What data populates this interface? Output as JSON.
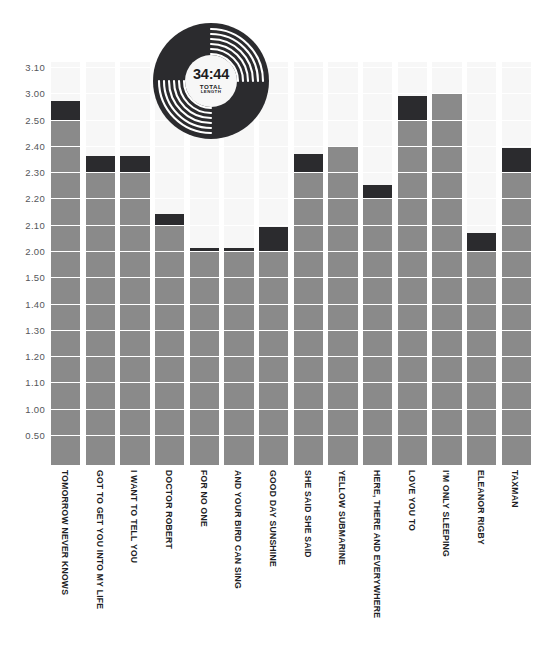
{
  "colors": {
    "bar_gray": "#8a8a8a",
    "bar_dark": "#2b2b2e",
    "column_bg": "#f7f7f7",
    "gridline": "#ffffff",
    "axis": "#b9b9b9",
    "tick_text": "#55565a",
    "label_text": "#1d1d1f"
  },
  "record": {
    "total_time": "34:44",
    "caption_line1": "TOTAL",
    "caption_line2": "LENGTH"
  },
  "chart_data": {
    "type": "bar",
    "title": "",
    "subtitle": "",
    "xlabel": "",
    "ylabel": "",
    "grid": true,
    "legend": "none",
    "note": "Stacked bar: gray body = whole tick increments, dark cap = remaining seconds above last tick. Y axis is a mm.ss time scale.",
    "ytick_labels": [
      "0.50",
      "1.00",
      "1.10",
      "1.20",
      "1.30",
      "1.40",
      "1.50",
      "2.00",
      "2.10",
      "2.20",
      "2.30",
      "2.40",
      "2.50",
      "3.00",
      "3.10"
    ],
    "ytick_values": [
      50,
      60,
      70,
      80,
      90,
      100,
      110,
      120,
      130,
      140,
      150,
      160,
      170,
      180,
      190
    ],
    "ylim_seconds": [
      26,
      190
    ],
    "categories": [
      "TOMORROW NEVER KNOWS",
      "GOT TO GET YOU INTO MY LIFE",
      "I WANT TO TELL YOU",
      "DOCTOR ROBERT",
      "FOR NO ONE",
      "AND YOUR BIRD CAN SING",
      "GOOD DAY SUNSHINE",
      "SHE SAID SHE SAID",
      "YELLOW SUBMARINE",
      "HERE, THERE AND EVERYWHERE",
      "LOVE YOU TO",
      "I'M ONLY SLEEPING",
      "ELEANOR RIGBY",
      "TAXMAN"
    ],
    "value_labels": [
      "2:57",
      "2:36",
      "2:36",
      "2:14",
      "2:01",
      "2:01",
      "2:09",
      "2:37",
      "2:40",
      "2:25",
      "2:59",
      "3:00",
      "2:07",
      "2:39"
    ],
    "values_seconds": [
      177,
      156,
      156,
      134,
      121,
      121,
      129,
      157,
      160,
      145,
      179,
      180,
      127,
      159
    ],
    "cap_top_seconds": [
      177,
      156,
      156,
      134,
      121,
      121,
      129,
      157,
      160,
      145,
      179,
      180,
      127,
      159
    ],
    "cap_base_seconds": [
      170,
      150,
      150,
      130,
      120,
      120,
      120,
      150,
      160,
      140,
      170,
      180,
      120,
      150
    ]
  }
}
